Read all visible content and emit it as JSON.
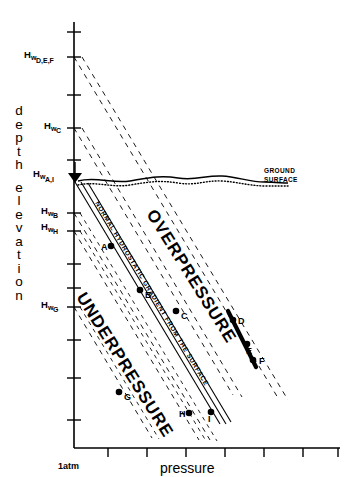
{
  "axes": {
    "x": {
      "label": "pressure",
      "origin_label": "1atm",
      "tick_count": 7
    },
    "y": {
      "label_line1": "depth",
      "label_line2": "elevation",
      "letters_1": [
        "d",
        "e",
        "p",
        "t",
        "h"
      ],
      "letters_2": [
        "e",
        "l",
        "e",
        "v",
        "a",
        "t",
        "i",
        "o",
        "n"
      ]
    }
  },
  "hydraulic_head_labels": [
    {
      "id": "hw-def",
      "prefix": "H",
      "w": "w",
      "sub": "D,E,F",
      "y": 57
    },
    {
      "id": "hw-c",
      "prefix": "H",
      "w": "w",
      "sub": "C",
      "y": 128
    },
    {
      "id": "hw-ai",
      "prefix": "H",
      "w": "w",
      "sub": "A,I",
      "y": 176
    },
    {
      "id": "hw-b",
      "prefix": "H",
      "w": "w",
      "sub": "B",
      "y": 213
    },
    {
      "id": "hw-h",
      "prefix": "H",
      "w": "w",
      "sub": "H",
      "y": 229
    },
    {
      "id": "hw-g",
      "prefix": "H",
      "w": "w",
      "sub": "G",
      "y": 307
    }
  ],
  "annotations": {
    "ground_surface_line1": "GROUND",
    "ground_surface_line2": "SURFACE",
    "overpressure": "OVERPRESSURE",
    "underpressure": "UNDERPRESSURE",
    "gradient_label": "NORMAL HYDROSTATIC GRADIENT FROM THE SURFACE"
  },
  "data_points": [
    {
      "label": "A",
      "x": 111,
      "y": 246,
      "label_dx": -10,
      "label_dy": 4
    },
    {
      "label": "B",
      "x": 140,
      "y": 290,
      "label_dx": 5,
      "label_dy": 8
    },
    {
      "label": "C",
      "x": 176,
      "y": 311,
      "label_dx": 5,
      "label_dy": 8
    },
    {
      "label": "D",
      "x": 233,
      "y": 320,
      "label_dx": 5,
      "label_dy": 4
    },
    {
      "label": "E",
      "x": 247,
      "y": 344,
      "label_dx": -1,
      "label_dy": 10
    },
    {
      "label": "F",
      "x": 253,
      "y": 360,
      "label_dx": 6,
      "label_dy": 4
    },
    {
      "label": "G",
      "x": 119,
      "y": 392,
      "label_dx": 5,
      "label_dy": 8
    },
    {
      "label": "H",
      "x": 189,
      "y": 413,
      "label_dx": -10,
      "label_dy": 4
    },
    {
      "label": "I",
      "x": 211,
      "y": 412,
      "label_dx": -3,
      "label_dy": 10
    }
  ],
  "colors": {
    "ink": "#000000",
    "background": "#ffffff"
  },
  "chart_data": {
    "type": "line",
    "xlabel": "pressure",
    "ylabel": "depth elevation",
    "x_origin_tick": "1atm",
    "grid": false,
    "legend": "none",
    "notes": [
      "Y axis is elevation increasing upward; X axis is pressure increasing rightward.",
      "Dashed straight lines are hydrostatic gradients projected down from each hydraulic head Hw on the elevation axis.",
      "Points left of a well's hydrostatic line are underpressured; points right are overpressured."
    ],
    "series": [
      {
        "name": "hydrostatic gradient from Hw D,E,F",
        "type": "dashed-gradient",
        "from": {
          "x": 74,
          "y": 57
        },
        "to": {
          "x": 276,
          "y": 395
        }
      },
      {
        "name": "hydrostatic gradient from Hw C",
        "type": "dashed-gradient",
        "from": {
          "x": 74,
          "y": 128
        },
        "to": {
          "x": 232,
          "y": 395
        }
      },
      {
        "name": "normal hydrostatic gradient from the surface (Hw A,I)",
        "type": "solid-band-gradient",
        "from": {
          "x": 74,
          "y": 182
        },
        "to": {
          "x": 218,
          "y": 420
        }
      },
      {
        "name": "hydrostatic gradient from Hw B",
        "type": "dashed-gradient",
        "from": {
          "x": 74,
          "y": 213
        },
        "to": {
          "x": 208,
          "y": 437
        }
      },
      {
        "name": "hydrostatic gradient from Hw H",
        "type": "dashed-gradient",
        "from": {
          "x": 74,
          "y": 229
        },
        "to": {
          "x": 200,
          "y": 437
        }
      },
      {
        "name": "hydrostatic gradient from Hw G",
        "type": "dashed-gradient",
        "from": {
          "x": 74,
          "y": 307
        },
        "to": {
          "x": 150,
          "y": 437
        }
      },
      {
        "name": "borehole D-E-F interval",
        "type": "thick-solid",
        "from": {
          "x": 228,
          "y": 312
        },
        "to": {
          "x": 256,
          "y": 366
        }
      },
      {
        "name": "ground surface",
        "type": "irregular-surface",
        "y_approx": 181
      }
    ],
    "point_labels": [
      "A",
      "B",
      "C",
      "D",
      "E",
      "F",
      "G",
      "H",
      "I"
    ]
  }
}
